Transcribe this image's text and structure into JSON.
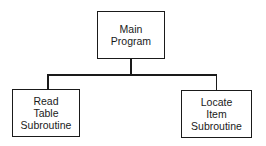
{
  "diagram": {
    "type": "hierarchy-chart",
    "root": {
      "label_lines": [
        "Main",
        "Program"
      ]
    },
    "children": [
      {
        "label_lines": [
          "Read",
          "Table",
          "Subroutine"
        ]
      },
      {
        "label_lines": [
          "Locate",
          "Item",
          "Subroutine"
        ]
      }
    ],
    "colors": {
      "stroke": "#1a1a1a",
      "background": "#ffffff"
    }
  }
}
